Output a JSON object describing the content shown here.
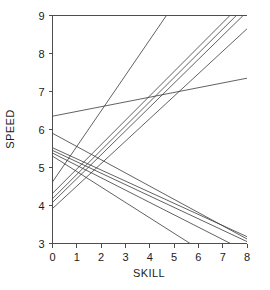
{
  "chart_data": {
    "type": "line",
    "title": "",
    "subtitle": "",
    "xlabel": "SKILL",
    "ylabel": "SPEED",
    "xlim": [
      0,
      8
    ],
    "ylim": [
      3,
      9
    ],
    "xticks": [
      0,
      1,
      2,
      3,
      4,
      5,
      6,
      7,
      8
    ],
    "xtick_labels": [
      "0",
      "1",
      "2",
      "3",
      "4",
      "5",
      "6",
      "7",
      "8"
    ],
    "yticks": [
      3,
      4,
      5,
      6,
      7,
      8,
      9
    ],
    "ytick_labels": [
      "3",
      "4",
      "5",
      "6",
      "7",
      "8",
      "9"
    ],
    "grid": false,
    "legend": null,
    "legend_position": "none",
    "annotations": [],
    "line_color": "#3a3a3a",
    "series": [
      {
        "name": "line-1",
        "comment": "shallow ascending, nearly flat",
        "x": [
          0,
          8
        ],
        "values": [
          6.35,
          7.35
        ]
      },
      {
        "name": "line-2",
        "comment": "moderate ascending from low left intercept",
        "x": [
          0,
          8
        ],
        "values": [
          3.92,
          8.65
        ]
      },
      {
        "name": "line-3",
        "comment": "steep ascending exiting top edge near x=5.4",
        "x": [
          0,
          8
        ],
        "values": [
          4.62,
          12.1
        ]
      },
      {
        "name": "line-4",
        "comment": "steep ascending bundle member, exits top near x=7.3",
        "x": [
          0,
          8
        ],
        "values": [
          4.32,
          9.45
        ]
      },
      {
        "name": "line-5",
        "comment": "steep ascending bundle member, exits top near x=7.6",
        "x": [
          0,
          8
        ],
        "values": [
          4.18,
          9.28
        ]
      },
      {
        "name": "line-6",
        "comment": "steep ascending bundle member, exits top near x=7.9",
        "x": [
          0,
          8
        ],
        "values": [
          4.08,
          9.1
        ]
      },
      {
        "name": "line-7",
        "comment": "descending, highest left intercept",
        "x": [
          0,
          8
        ],
        "values": [
          5.9,
          3.12
        ]
      },
      {
        "name": "line-8",
        "comment": "descending bundle member reaching right edge",
        "x": [
          0,
          8
        ],
        "values": [
          5.52,
          3.18
        ]
      },
      {
        "name": "line-9",
        "comment": "descending bundle member reaching right edge",
        "x": [
          0,
          8
        ],
        "values": [
          5.45,
          3.05
        ]
      },
      {
        "name": "line-10",
        "comment": "descending crossing y=3 near x=7.2",
        "x": [
          0,
          8
        ],
        "values": [
          5.38,
          2.78
        ]
      },
      {
        "name": "line-11",
        "comment": "steepest descending, crossing y=3 near x=6.2",
        "x": [
          0,
          8
        ],
        "values": [
          5.3,
          2.05
        ]
      }
    ]
  }
}
